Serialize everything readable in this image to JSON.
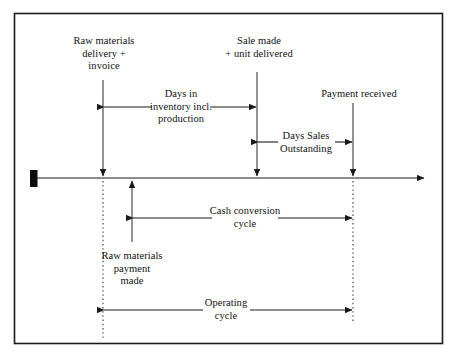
{
  "figure": {
    "type": "timeline-diagram",
    "title_visible": false,
    "border": {
      "color": "#1a1a1a",
      "style": "solid"
    },
    "background": "#ffffff",
    "line_color": "#1a1a1a",
    "dotted_color": "#333333"
  },
  "timeline": {
    "name": "time-axis",
    "start_marker": "filled-rectangle",
    "end_marker": "arrowhead",
    "axis_y": 178,
    "axis_x_start": 37,
    "axis_x_end": 427
  },
  "events": [
    {
      "id": "raw-materials-delivery",
      "label": "Raw materials\ndelivery +\ninvoice",
      "x": 103,
      "side": "above"
    },
    {
      "id": "sale-made",
      "label": "Sale made\n+ unit delivered",
      "x": 257,
      "side": "above"
    },
    {
      "id": "payment-received",
      "label": "Payment received",
      "x": 353,
      "side": "above"
    },
    {
      "id": "raw-materials-payment",
      "label": "Raw materials\npayment\nmade",
      "x": 132,
      "side": "below"
    }
  ],
  "measures": [
    {
      "id": "days-in-inventory",
      "label": "Days in\ninventory incl.\nproduction",
      "from_x": 103,
      "to_x": 257,
      "y": 107,
      "region": "above-axis"
    },
    {
      "id": "days-sales-outstanding",
      "label": "Days Sales\nOutstanding",
      "from_x": 257,
      "to_x": 353,
      "y": 142,
      "region": "above-axis"
    },
    {
      "id": "cash-conversion-cycle",
      "label": "Cash conversion\ncycle",
      "from_x": 132,
      "to_x": 353,
      "y": 218,
      "region": "below-axis"
    },
    {
      "id": "operating-cycle",
      "label": "Operating\ncycle",
      "from_x": 103,
      "to_x": 353,
      "y": 310,
      "region": "below-axis"
    }
  ]
}
